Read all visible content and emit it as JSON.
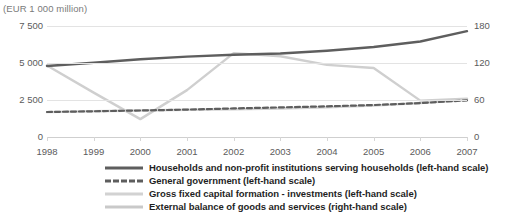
{
  "header": {
    "title_clipped": "Figure 3: Main GDP components, euro area (EUR 1 000 million)",
    "subtitle": "(EUR 1 000 million)"
  },
  "chart_data": {
    "type": "line",
    "title": "",
    "subtitle": "(EUR 1 000 million)",
    "xlabel": "",
    "ylabel": "",
    "grid": true,
    "legend_position": "bottom",
    "categories": [
      "1998",
      "1999",
      "2000",
      "2001",
      "2002",
      "2003",
      "2004",
      "2005",
      "2006",
      "2007"
    ],
    "x": [
      1998,
      1999,
      2000,
      2001,
      2002,
      2003,
      2004,
      2005,
      2006,
      2007
    ],
    "left_axis": {
      "label": "",
      "ticks": [
        "0",
        "2 500",
        "5 000",
        "7 500"
      ],
      "tick_values": [
        0,
        2500,
        5000,
        7500
      ],
      "ylim": [
        0,
        7500
      ]
    },
    "right_axis": {
      "label": "",
      "ticks": [
        "0",
        "60",
        "120",
        "180"
      ],
      "tick_values": [
        0,
        60,
        120,
        180
      ],
      "ylim": [
        0,
        180
      ]
    },
    "series": [
      {
        "name": "Households and non-profit institutions serving households (left-hand scale)",
        "short": "households",
        "scale": "left",
        "style": "solid",
        "color": "#5e5e5e",
        "values": [
          4800,
          5020,
          5250,
          5430,
          5560,
          5640,
          5830,
          6080,
          6450,
          7150
        ]
      },
      {
        "name": "General government (left-hand scale)",
        "short": "general-government",
        "scale": "left",
        "style": "dashed",
        "color": "#5e5e5e",
        "values": [
          1690,
          1740,
          1790,
          1850,
          1930,
          2000,
          2070,
          2160,
          2290,
          2480
        ]
      },
      {
        "name": "Gross fixed capital formation - investments (left-hand scale)",
        "short": "gross-fixed-capital-formation",
        "scale": "left",
        "style": "solid",
        "color": "#d2d2d2",
        "values": [
          1680,
          1740,
          1790,
          1840,
          1880,
          1930,
          2010,
          2120,
          2300,
          2500
        ]
      },
      {
        "name": "External balance of goods and services (right-hand scale)",
        "short": "external-balance",
        "scale": "right",
        "style": "solid",
        "color": "#cfcfcf",
        "values": [
          116,
          72,
          29,
          76,
          136,
          131,
          117,
          112,
          59,
          62
        ]
      }
    ]
  },
  "legend": {
    "items": [
      {
        "label": "Households and non-profit institutions serving households (left-hand scale)",
        "swatch": "solid-dark"
      },
      {
        "label": "General government (left-hand scale)",
        "swatch": "dash-dark"
      },
      {
        "label": "Gross fixed capital formation - investments (left-hand scale)",
        "swatch": "light"
      },
      {
        "label": "External balance of goods and services (right-hand scale)",
        "swatch": "light"
      }
    ]
  }
}
